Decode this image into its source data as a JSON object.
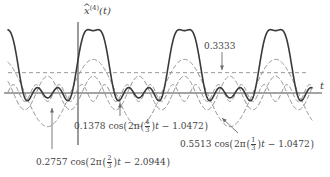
{
  "figure": {
    "title_axis_y": "x̂⁽⁴⁾(t)",
    "axis_y_base_symbol": "x",
    "axis_y_hat": "^",
    "axis_y_superscript": "(4)",
    "axis_y_argument": "(t)",
    "axis_x_label": "t",
    "background_color": "#ffffff",
    "sum_curve_color": "#3a3a3a",
    "harmonic_color": "#8e8e8e",
    "axis_color": "#4a4a4a",
    "leader_color": "#6b6b6b"
  },
  "annotations": {
    "dc": {
      "text": "0.3333",
      "value": 0.3333,
      "arrow_from_x": 222,
      "arrow_from_y": 52,
      "arrow_to_x": 222,
      "arrow_to_y": 70,
      "label_x": 204,
      "label_y": 42
    },
    "harmonic_a": {
      "amplitude_text": "0.2757",
      "cos_text": "cos",
      "two_pi_text": "2π",
      "freq_num": "2",
      "freq_den": "3",
      "t_text": "t",
      "minus_text": "−",
      "phase_text": "2.0944",
      "label_x": 36,
      "label_y": 155,
      "arrow_from_x": 52,
      "arrow_from_y": 149,
      "arrow_to_x": 52,
      "arrow_to_y": 108
    },
    "harmonic_b": {
      "amplitude_text": "0.1378",
      "cos_text": "cos",
      "two_pi_text": "2π",
      "freq_num": "4",
      "freq_den": "3",
      "t_text": "t",
      "minus_text": "−",
      "phase_text": "1.0472",
      "label_x": 74,
      "label_y": 119,
      "arrow_from_x": 120,
      "arrow_from_y": 116,
      "arrow_to_x": 120,
      "arrow_to_y": 103
    },
    "harmonic_c": {
      "amplitude_text": "0.5513",
      "cos_text": "cos",
      "two_pi_text": "2π",
      "freq_num": "1",
      "freq_den": "3",
      "t_text": "t",
      "minus_text": "−",
      "phase_text": "1.0472",
      "label_x": 180,
      "label_y": 137,
      "arrow_from_x": 238,
      "arrow_from_y": 133,
      "arrow_to_x": 222,
      "arrow_to_y": 118
    }
  },
  "chart_data": {
    "type": "line",
    "title": "",
    "xlabel": "t",
    "ylabel": "x̂⁽⁴⁾(t)",
    "grid": false,
    "legend": "none",
    "xlim": [
      -1.45,
      6.3
    ],
    "ylim": [
      -0.78,
      1.28
    ],
    "axis_origin_px": {
      "x": 78,
      "y": 93
    },
    "px_per_unit_x": 30.4,
    "px_per_unit_y": 61.0,
    "plot_x_start_px": 8,
    "plot_x_end_px": 312,
    "dc_offset": 0.3333,
    "series": [
      {
        "name": "0.5513 cos(2π(1/3)t − 1.0472)",
        "kind": "cosine",
        "amplitude": 0.5513,
        "frequency": 0.3333333,
        "phase": 1.0472,
        "style": "dashed",
        "color": "#8e8e8e"
      },
      {
        "name": "0.2757 cos(2π(2/3)t − 2.0944)",
        "kind": "cosine",
        "amplitude": 0.2757,
        "frequency": 0.6666667,
        "phase": 2.0944,
        "style": "dashed",
        "color": "#8e8e8e"
      },
      {
        "name": "0.1378 cos(2π(4/3)t − 1.0472)",
        "kind": "cosine",
        "amplitude": 0.1378,
        "frequency": 1.3333333,
        "phase": 1.0472,
        "style": "dashed",
        "color": "#8e8e8e"
      },
      {
        "name": "0.3333",
        "kind": "constant",
        "amplitude": 0.3333,
        "frequency": 0,
        "phase": 0,
        "style": "dashed",
        "color": "#9a9a9a"
      },
      {
        "name": "x̂⁽⁴⁾(t)",
        "kind": "sum",
        "components": [
          0,
          1,
          2
        ],
        "include_dc": true,
        "style": "solid",
        "color": "#3a3a3a"
      }
    ]
  }
}
